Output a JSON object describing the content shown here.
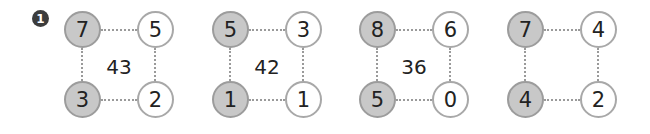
{
  "problem_number": "1",
  "groups": [
    {
      "top_left": "7",
      "top_right": "5",
      "bottom_left": "3",
      "bottom_right": "2",
      "center": "43"
    },
    {
      "top_left": "5",
      "top_right": "3",
      "bottom_left": "1",
      "bottom_right": "1",
      "center": "42"
    },
    {
      "top_left": "8",
      "top_right": "6",
      "bottom_left": "5",
      "bottom_right": "0",
      "center": "36"
    },
    {
      "top_left": "7",
      "top_right": "4",
      "bottom_left": "4",
      "bottom_right": "2",
      "center": ""
    }
  ],
  "colors": {
    "shaded_fill": "#c8c8c8",
    "border": "#a8a8a8",
    "badge": "#3c3c3c"
  }
}
